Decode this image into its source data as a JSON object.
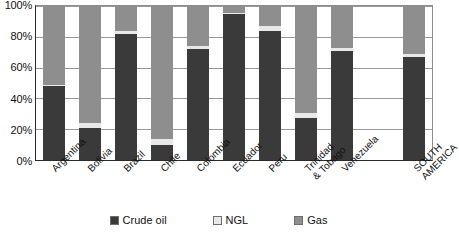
{
  "chart_data": {
    "type": "bar",
    "subtype": "stacked-100-percent",
    "title": "",
    "xlabel": "",
    "ylabel": "",
    "ylim": [
      0,
      100
    ],
    "ytick_labels": [
      "0%",
      "20%",
      "40%",
      "60%",
      "80%",
      "100%"
    ],
    "ytick_values": [
      0,
      20,
      40,
      60,
      80,
      100
    ],
    "grid": true,
    "legend_position": "bottom",
    "categories": [
      "Argentina",
      "Bolivia",
      "Brazil",
      "Chile",
      "Colombia",
      "Ecuador",
      "Peru",
      "Trinidad & Tobago",
      "Venezuela",
      "",
      "SOUTH AMERICA"
    ],
    "series": [
      {
        "name": "Crude oil",
        "color": "#3a3a3a",
        "values": [
          48,
          21,
          82,
          9.5,
          72,
          95,
          84,
          27.5,
          70.5,
          null,
          67
        ]
      },
      {
        "name": "NGL",
        "color": "#e8e8e8",
        "values": [
          1,
          3,
          1.5,
          4,
          2,
          0.5,
          3,
          3,
          2.5,
          null,
          2
        ]
      },
      {
        "name": "Gas",
        "color": "#8e8e8e",
        "values": [
          51,
          76,
          16.5,
          86.5,
          26,
          4.5,
          13,
          69.5,
          27,
          null,
          31
        ]
      }
    ]
  },
  "axis": {
    "y_labels": [
      "100%",
      "80%",
      "60%",
      "40%",
      "20%",
      "0%"
    ]
  },
  "x_labels": [
    {
      "lines": [
        "Argentina"
      ]
    },
    {
      "lines": [
        "Bolivia"
      ]
    },
    {
      "lines": [
        "Brazil"
      ]
    },
    {
      "lines": [
        "Chile"
      ]
    },
    {
      "lines": [
        "Colombia"
      ]
    },
    {
      "lines": [
        "Ecuador"
      ]
    },
    {
      "lines": [
        "Peru"
      ]
    },
    {
      "lines": [
        "Trinidad",
        "& Tobago"
      ]
    },
    {
      "lines": [
        "Venezuela"
      ]
    },
    {
      "lines": [
        ""
      ]
    },
    {
      "lines": [
        "SOUTH",
        "AMERICA"
      ]
    }
  ],
  "legend": {
    "items": [
      {
        "label": "Crude oil",
        "color": "#3a3a3a",
        "icon": "square-swatch-icon"
      },
      {
        "label": "NGL",
        "color": "#e8e8e8",
        "icon": "square-swatch-icon"
      },
      {
        "label": "Gas",
        "color": "#8e8e8e",
        "icon": "square-swatch-icon"
      }
    ]
  }
}
